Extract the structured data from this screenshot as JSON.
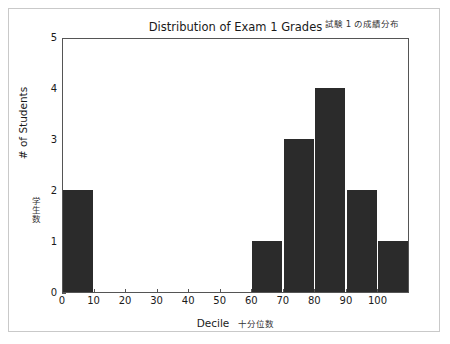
{
  "chart_data": {
    "type": "bar",
    "title": "Distribution of Exam 1 Grades",
    "title_annotation": "試験 1 の成績分布",
    "xlabel": "Decile",
    "xlabel_annotation": "十分位数",
    "ylabel": "# of Students",
    "ylabel_annotation": "学生数",
    "categories": [
      "0",
      "10",
      "20",
      "30",
      "40",
      "50",
      "60",
      "70",
      "80",
      "90",
      "100"
    ],
    "values": [
      2,
      0,
      0,
      0,
      0,
      0,
      1,
      3,
      4,
      2,
      1
    ],
    "xtick_labels": [
      "0",
      "10",
      "20",
      "30",
      "40",
      "50",
      "60",
      "70",
      "80",
      "90",
      "100"
    ],
    "ytick_labels": [
      "0",
      "1",
      "2",
      "3",
      "4",
      "5"
    ],
    "xlim": [
      0,
      110
    ],
    "ylim": [
      0,
      5
    ],
    "bar_width": 10,
    "bar_color": "#2b2b2b",
    "axis_color": "#555555",
    "grid": false,
    "legend": false
  }
}
